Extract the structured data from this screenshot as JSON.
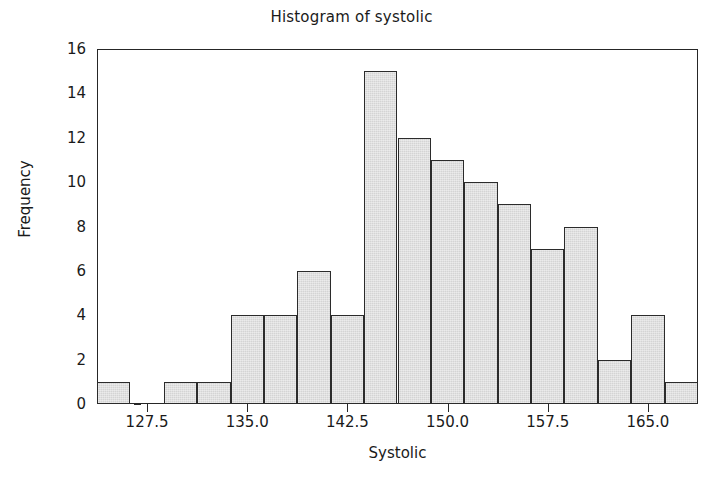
{
  "chart_data": {
    "type": "bar",
    "title": "Histogram of systolic",
    "xlabel": "Systolic",
    "ylabel": "Frequency",
    "grid": false,
    "legend": false,
    "bin_width": 2.5,
    "bin_starts": [
      123.75,
      126.25,
      128.75,
      131.25,
      133.75,
      136.25,
      138.75,
      141.25,
      143.75,
      146.25,
      148.75,
      151.25,
      153.75,
      156.25,
      158.75,
      161.25,
      163.75,
      166.25
    ],
    "bin_centers": [
      125,
      127.5,
      130,
      132.5,
      135,
      137.5,
      140,
      142.5,
      145,
      147.5,
      150,
      152.5,
      155,
      157.5,
      160,
      162.5,
      165,
      167.5
    ],
    "values": [
      1,
      0,
      1,
      1,
      4,
      4,
      6,
      4,
      15,
      12,
      11,
      10,
      9,
      7,
      8,
      2,
      4,
      1
    ],
    "xlim": [
      123.75,
      168.75
    ],
    "ylim": [
      0,
      16
    ],
    "xticks": [
      "127.5",
      "135.0",
      "142.5",
      "150.0",
      "157.5",
      "165.0"
    ],
    "xtick_values": [
      127.5,
      135.0,
      142.5,
      150.0,
      157.5,
      165.0
    ],
    "yticks": [
      "0",
      "2",
      "4",
      "6",
      "8",
      "10",
      "12",
      "14",
      "16"
    ],
    "ytick_values": [
      0,
      2,
      4,
      6,
      8,
      10,
      12,
      14,
      16
    ],
    "colors": {
      "bar_fill": "#d4d4d4",
      "bar_edge": "#2b2b2b",
      "axis": "#262626",
      "text": "#1a1a1a",
      "background": "#ffffff"
    }
  }
}
